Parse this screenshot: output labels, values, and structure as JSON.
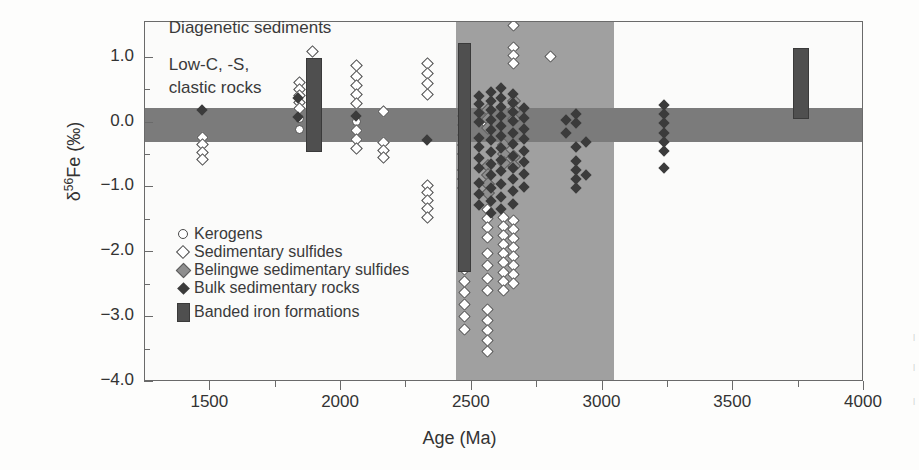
{
  "chart_data": {
    "type": "scatter",
    "title": "",
    "xlabel": "Age (Ma)",
    "ylabel_prefix": "δ",
    "ylabel_sup": "56",
    "ylabel_suffix": "Fe (‰)",
    "xlim": [
      1250,
      4000
    ],
    "ylim": [
      -4.0,
      1.55
    ],
    "xticks": [
      1500,
      2000,
      2500,
      3000,
      3500,
      4000
    ],
    "xtick_labels": [
      "1500",
      "2000",
      "2500",
      "3000",
      "3500",
      "4000"
    ],
    "xminor": [
      1250,
      1750,
      2250,
      2750,
      3250,
      3750
    ],
    "yticks": [
      1.0,
      0.0,
      -1.0,
      -2.0,
      -3.0,
      -4.0
    ],
    "ytick_labels": [
      "1.0",
      "0.0",
      "−1.0",
      "−2.0",
      "−3.0",
      "−4.0"
    ],
    "yminor": [
      0.5,
      -0.5,
      -1.5,
      -2.5,
      -3.5
    ],
    "grid": false,
    "legend_position": "inside-lower-left",
    "annotations": [
      {
        "text": "Diagenetic sediments",
        "x": 1345,
        "y": 1.42
      },
      {
        "text": "Low-C, -S,",
        "x": 1345,
        "y": 0.86
      },
      {
        "text": "clastic rocks",
        "x": 1345,
        "y": 0.5
      }
    ],
    "shaded_regions": [
      {
        "name": "archean-age-band",
        "orientation": "vertical",
        "x_start": 2440,
        "x_end": 3045,
        "color": "#a0a0a0"
      },
      {
        "name": "igneous-baseline-band",
        "orientation": "horizontal",
        "y_start": 0.22,
        "y_end": -0.3,
        "color": "#7b7b7b"
      }
    ],
    "series": [
      {
        "name": "Kerogens",
        "marker": "open-circle",
        "color": "#ffffff",
        "edge": "#4a4a4a",
        "points": [
          [
            1838,
            0.06
          ],
          [
            1838,
            -0.1
          ],
          [
            2058,
            0.02
          ],
          [
            2058,
            -0.12
          ],
          [
            2470,
            0.22
          ],
          [
            2470,
            -0.06
          ],
          [
            2470,
            -0.24
          ]
        ]
      },
      {
        "name": "Sedimentary sulfides",
        "marker": "open-diamond",
        "color": "#ffffff",
        "edge": "#4a4a4a",
        "points": [
          [
            1470,
            -0.23
          ],
          [
            1470,
            -0.34
          ],
          [
            1470,
            -0.45
          ],
          [
            1470,
            -0.56
          ],
          [
            1838,
            0.62
          ],
          [
            1838,
            0.52
          ],
          [
            1838,
            0.42
          ],
          [
            1838,
            0.32
          ],
          [
            1838,
            0.22
          ],
          [
            1890,
            1.1
          ],
          [
            2058,
            0.88
          ],
          [
            2058,
            0.72
          ],
          [
            2058,
            0.58
          ],
          [
            2058,
            0.44
          ],
          [
            2058,
            0.3
          ],
          [
            2058,
            -0.12
          ],
          [
            2058,
            -0.26
          ],
          [
            2058,
            -0.4
          ],
          [
            2160,
            0.17
          ],
          [
            2160,
            -0.3
          ],
          [
            2160,
            -0.42
          ],
          [
            2160,
            -0.54
          ],
          [
            2330,
            0.92
          ],
          [
            2330,
            0.76
          ],
          [
            2330,
            0.6
          ],
          [
            2330,
            0.44
          ],
          [
            2330,
            -0.96
          ],
          [
            2330,
            -1.08
          ],
          [
            2330,
            -1.2
          ],
          [
            2330,
            -1.32
          ],
          [
            2330,
            -1.46
          ],
          [
            2470,
            -1.02
          ],
          [
            2470,
            -1.16
          ],
          [
            2470,
            -1.3
          ],
          [
            2470,
            -1.44
          ],
          [
            2470,
            -1.58
          ],
          [
            2470,
            -1.7
          ],
          [
            2470,
            -1.84
          ],
          [
            2470,
            -1.98
          ],
          [
            2470,
            -2.12
          ],
          [
            2470,
            -2.26
          ],
          [
            2470,
            -2.44
          ],
          [
            2470,
            -2.62
          ],
          [
            2470,
            -2.8
          ],
          [
            2470,
            -2.98
          ],
          [
            2470,
            -3.18
          ],
          [
            2560,
            0.18
          ],
          [
            2560,
            -0.02
          ],
          [
            2560,
            -1.34
          ],
          [
            2560,
            -1.48
          ],
          [
            2560,
            -1.62
          ],
          [
            2560,
            -1.76
          ],
          [
            2560,
            -2.02
          ],
          [
            2560,
            -2.2
          ],
          [
            2560,
            -2.4
          ],
          [
            2560,
            -2.58
          ],
          [
            2560,
            -2.88
          ],
          [
            2560,
            -3.04
          ],
          [
            2560,
            -3.2
          ],
          [
            2560,
            -3.36
          ],
          [
            2560,
            -3.52
          ],
          [
            2620,
            -1.46
          ],
          [
            2620,
            -1.6
          ],
          [
            2620,
            -1.74
          ],
          [
            2620,
            -1.88
          ],
          [
            2620,
            -2.02
          ],
          [
            2620,
            -2.16
          ],
          [
            2620,
            -2.3
          ],
          [
            2620,
            -2.44
          ],
          [
            2620,
            -2.58
          ],
          [
            2660,
            1.5
          ],
          [
            2660,
            1.16
          ],
          [
            2660,
            1.04
          ],
          [
            2660,
            0.92
          ],
          [
            2660,
            -1.5
          ],
          [
            2660,
            -1.64
          ],
          [
            2660,
            -1.78
          ],
          [
            2660,
            -1.92
          ],
          [
            2660,
            -2.06
          ],
          [
            2660,
            -2.2
          ],
          [
            2660,
            -2.34
          ],
          [
            2660,
            -2.48
          ],
          [
            2800,
            1.02
          ]
        ]
      },
      {
        "name": "Belingwe sedimentary sulfides",
        "marker": "gray-diamond",
        "color": "#8e8e8e",
        "edge": "#5b5b5b",
        "points": [
          [
            2470,
            0.1
          ],
          [
            2470,
            -0.04
          ],
          [
            2470,
            -0.18
          ],
          [
            2470,
            -0.34
          ],
          [
            2470,
            -0.48
          ],
          [
            2470,
            -0.72
          ],
          [
            2470,
            -0.86
          ],
          [
            2470,
            -1.0
          ],
          [
            2560,
            0.2
          ],
          [
            2560,
            0.06
          ],
          [
            2560,
            -0.08
          ],
          [
            2560,
            -0.66
          ],
          [
            2560,
            -0.8
          ],
          [
            2560,
            -0.94
          ],
          [
            2560,
            -1.08
          ],
          [
            2620,
            -0.34
          ],
          [
            2620,
            -0.48
          ],
          [
            2620,
            -0.62
          ],
          [
            2660,
            0.34
          ],
          [
            2660,
            0.2
          ],
          [
            2660,
            0.06
          ],
          [
            2660,
            -0.52
          ],
          [
            2660,
            -0.66
          ]
        ]
      },
      {
        "name": "Bulk sedimentary rocks",
        "marker": "black-diamond",
        "color": "#3b3b3b",
        "edge": "#3b3b3b",
        "points": [
          [
            1470,
            0.18
          ],
          [
            1838,
            0.38
          ],
          [
            1838,
            0.08
          ],
          [
            2058,
            0.1
          ],
          [
            2330,
            -0.28
          ],
          [
            2470,
            0.26
          ],
          [
            2470,
            -0.12
          ],
          [
            2470,
            -0.3
          ],
          [
            2470,
            -0.62
          ],
          [
            2470,
            -0.9
          ],
          [
            2530,
            0.4
          ],
          [
            2530,
            0.28
          ],
          [
            2530,
            0.14
          ],
          [
            2530,
            0.0
          ],
          [
            2530,
            -0.24
          ],
          [
            2530,
            -0.38
          ],
          [
            2530,
            -0.56
          ],
          [
            2530,
            -0.7
          ],
          [
            2530,
            -0.94
          ],
          [
            2530,
            -1.1
          ],
          [
            2530,
            -1.28
          ],
          [
            2575,
            0.46
          ],
          [
            2575,
            0.32
          ],
          [
            2575,
            0.18
          ],
          [
            2575,
            0.04
          ],
          [
            2575,
            -0.12
          ],
          [
            2575,
            -0.28
          ],
          [
            2575,
            -0.46
          ],
          [
            2575,
            -0.64
          ],
          [
            2575,
            -0.82
          ],
          [
            2575,
            -1.02
          ],
          [
            2575,
            -1.22
          ],
          [
            2575,
            -1.4
          ],
          [
            2615,
            0.52
          ],
          [
            2615,
            0.38
          ],
          [
            2615,
            0.24
          ],
          [
            2615,
            0.1
          ],
          [
            2615,
            -0.06
          ],
          [
            2615,
            -0.22
          ],
          [
            2615,
            -0.4
          ],
          [
            2615,
            -0.58
          ],
          [
            2615,
            -0.76
          ],
          [
            2615,
            -0.96
          ],
          [
            2615,
            -1.16
          ],
          [
            2615,
            -1.34
          ],
          [
            2660,
            0.44
          ],
          [
            2660,
            0.3
          ],
          [
            2660,
            0.16
          ],
          [
            2660,
            0.02
          ],
          [
            2660,
            -0.16
          ],
          [
            2660,
            -0.34
          ],
          [
            2660,
            -0.52
          ],
          [
            2660,
            -0.7
          ],
          [
            2660,
            -0.88
          ],
          [
            2660,
            -1.06
          ],
          [
            2660,
            -1.26
          ],
          [
            2700,
            0.22
          ],
          [
            2700,
            0.06
          ],
          [
            2700,
            -0.1
          ],
          [
            2700,
            -0.26
          ],
          [
            2700,
            -0.44
          ],
          [
            2700,
            -0.62
          ],
          [
            2700,
            -0.8
          ],
          [
            2700,
            -1.0
          ],
          [
            2860,
            0.04
          ],
          [
            2860,
            -0.16
          ],
          [
            2900,
            0.12
          ],
          [
            2900,
            -0.02
          ],
          [
            2900,
            -0.38
          ],
          [
            2900,
            -0.6
          ],
          [
            2900,
            -0.74
          ],
          [
            2900,
            -0.88
          ],
          [
            2900,
            -1.02
          ],
          [
            2940,
            -0.3
          ],
          [
            2940,
            -0.82
          ],
          [
            3235,
            0.26
          ],
          [
            3235,
            0.12
          ],
          [
            3235,
            -0.02
          ],
          [
            3235,
            -0.16
          ],
          [
            3235,
            -0.3
          ],
          [
            3235,
            -0.44
          ],
          [
            3235,
            -0.7
          ]
        ]
      }
    ],
    "bif_bars": [
      {
        "name": "bif-1890",
        "x_center": 1893,
        "width_ma": 55,
        "y_top": 1.0,
        "y_bottom": -0.42
      },
      {
        "name": "bif-2470",
        "x_center": 2468,
        "width_ma": 40,
        "y_top": 1.22,
        "y_bottom": -2.28
      },
      {
        "name": "bif-3750",
        "x_center": 3755,
        "width_ma": 55,
        "y_top": 1.15,
        "y_bottom": 0.08
      }
    ]
  },
  "legend": {
    "items": [
      {
        "label": "Kerogens",
        "symbol": "open-circle"
      },
      {
        "label": "Sedimentary sulfides",
        "symbol": "open-diamond"
      },
      {
        "label": "Belingwe sedimentary sulfides",
        "symbol": "gray-diamond"
      },
      {
        "label": "Bulk sedimentary rocks",
        "symbol": "black-diamond"
      },
      {
        "label": "Banded iron formations",
        "symbol": "dark-bar"
      }
    ]
  }
}
